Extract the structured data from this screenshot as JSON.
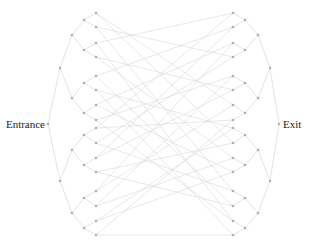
{
  "labels": {
    "entrance": "Entrance",
    "exit": "Exit"
  },
  "colors": {
    "background": "#ffffff",
    "edge": "#d8d8d8",
    "node": "#b0b0b0",
    "text": "#222222"
  },
  "graph": {
    "entrance": {
      "x": 48,
      "y": 124
    },
    "exit": {
      "x": 279,
      "y": 124
    },
    "left_levels_x": [
      60,
      72,
      84,
      96
    ],
    "right_levels_x": [
      270,
      258,
      245,
      233
    ],
    "level1_y": [
      68,
      181
    ],
    "level2_y": [
      35,
      98,
      150,
      213
    ],
    "level3_y": [
      20,
      50,
      83,
      113,
      135,
      165,
      198,
      228
    ],
    "leaf_y": [
      13,
      27,
      43,
      57,
      76,
      90,
      105,
      120,
      128,
      143,
      158,
      172,
      191,
      206,
      221,
      235
    ],
    "crossing_edges": [
      [
        0,
        6
      ],
      [
        0,
        9
      ],
      [
        1,
        12
      ],
      [
        1,
        3
      ],
      [
        2,
        14
      ],
      [
        2,
        0
      ],
      [
        3,
        10
      ],
      [
        3,
        5
      ],
      [
        4,
        1
      ],
      [
        4,
        13
      ],
      [
        5,
        8
      ],
      [
        5,
        15
      ],
      [
        6,
        2
      ],
      [
        6,
        11
      ],
      [
        7,
        4
      ],
      [
        7,
        14
      ],
      [
        8,
        0
      ],
      [
        8,
        7
      ],
      [
        9,
        12
      ],
      [
        9,
        3
      ],
      [
        10,
        5
      ],
      [
        10,
        1
      ],
      [
        11,
        9
      ],
      [
        11,
        13
      ],
      [
        12,
        6
      ],
      [
        12,
        2
      ],
      [
        13,
        10
      ],
      [
        13,
        4
      ],
      [
        14,
        8
      ],
      [
        14,
        11
      ],
      [
        15,
        15
      ],
      [
        15,
        7
      ]
    ]
  }
}
